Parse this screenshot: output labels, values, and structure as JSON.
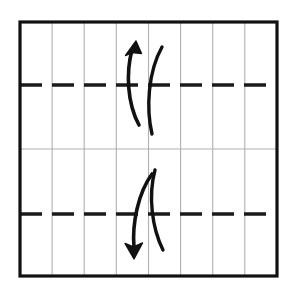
{
  "diagram": {
    "title": "Origami pleat fold diagram",
    "type": "origami-fold-instruction",
    "caption": "",
    "canvas": {
      "width": 292,
      "height": 291,
      "background": "#ffffff"
    },
    "colors": {
      "paper_border": "#111111",
      "grid_line": "#b0b0b0",
      "fold_line": "#1a1a1a",
      "arrow": "#111111",
      "paper_fill": "#ffffff"
    },
    "paper": {
      "label": "square paper sheet",
      "x": 20,
      "y": 22,
      "width": 257,
      "height": 254,
      "border_width": 3.2
    },
    "grid": {
      "label": "crease grid",
      "columns": 8,
      "rows": 2,
      "vertical_lines_x": [
        52.1,
        84.2,
        116.3,
        148.5,
        180.6,
        212.7,
        244.8
      ],
      "horizontal_center_line_y": 149,
      "line_width": 1.1
    },
    "fold_lines": [
      {
        "name": "upper-mountain-fold-line",
        "style": "dashed",
        "y": 85,
        "x1": 20,
        "x2": 277,
        "stroke_width": 3.4,
        "dash": "22 10",
        "meaning": "mountain fold"
      },
      {
        "name": "lower-mountain-fold-line",
        "style": "dashed",
        "y": 214,
        "x1": 20,
        "x2": 277,
        "stroke_width": 3.4,
        "dash": "22 10",
        "meaning": "mountain fold"
      }
    ],
    "arrows": [
      {
        "name": "upper-fold-arrow",
        "direction": "up",
        "meaning": "fold edge upward",
        "path": "M 139 125 C 127 103 126 72 132 50",
        "head": {
          "tip_x": 136,
          "tip_y": 41,
          "left_x": 125,
          "left_y": 54,
          "right_x": 142,
          "right_y": 52
        },
        "stroke_width": 3.6
      },
      {
        "name": "upper-companion-curve",
        "direction": "none",
        "meaning": "paper edge travel path",
        "path": "M 162 47 C 148 72 146 108 152 134",
        "stroke_width": 3.4
      },
      {
        "name": "lower-fold-arrow",
        "direction": "down",
        "meaning": "fold edge downward",
        "path": "M 152 174 C 138 193 132 224 134 247",
        "head": {
          "tip_x": 134,
          "tip_y": 258,
          "left_x": 126,
          "left_y": 243,
          "right_x": 143,
          "right_y": 244
        },
        "stroke_width": 3.6
      },
      {
        "name": "lower-companion-curve",
        "direction": "none",
        "meaning": "paper edge travel path",
        "path": "M 155 170 C 148 196 152 228 163 250",
        "stroke_width": 3.4
      }
    ]
  }
}
